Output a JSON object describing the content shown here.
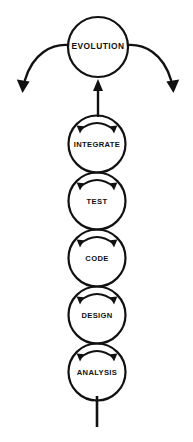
{
  "diagram": {
    "type": "flow-diagram",
    "background_color": "#ffffff",
    "stroke_color": "#111111",
    "text_color": "#111111",
    "top_node": {
      "id": "evolution",
      "label": "EVOLUTION",
      "shape": "circle",
      "cx": 98,
      "cy": 47,
      "r": 30,
      "stroke_width": 2.2
    },
    "stages": [
      {
        "id": "integrate",
        "label": "INTEGRATE",
        "shape": "circle",
        "cx": 97,
        "cy": 144,
        "r": 28.5,
        "stroke_width": 2.2,
        "order": 1
      },
      {
        "id": "test",
        "label": "TEST",
        "shape": "circle",
        "cx": 97,
        "cy": 201,
        "r": 28.5,
        "stroke_width": 2.2,
        "order": 2
      },
      {
        "id": "code",
        "label": "CODE",
        "shape": "circle",
        "cx": 97,
        "cy": 258,
        "r": 28.5,
        "stroke_width": 2.2,
        "order": 3
      },
      {
        "id": "design",
        "label": "DESIGN",
        "shape": "circle",
        "cx": 97,
        "cy": 315,
        "r": 28.5,
        "stroke_width": 2.2,
        "order": 4
      },
      {
        "id": "analysis",
        "label": "ANALYSIS",
        "shape": "circle",
        "cx": 97,
        "cy": 372,
        "r": 28.5,
        "stroke_width": 2.2,
        "order": 5
      }
    ],
    "connectors": {
      "entry_line": {
        "id": "entry-line",
        "description": "vertical line entering the stack from below ANALYSIS",
        "x": 97,
        "y_start": 400,
        "y_end": 427,
        "stroke_width": 2.6,
        "arrow": false
      },
      "evolution_arrow": {
        "id": "evolution-arrow",
        "description": "vertical arrow from INTEGRATE up into EVOLUTION",
        "x": 98,
        "y_start": 116,
        "y_end": 80,
        "stroke_width": 2.4,
        "arrow": true,
        "arrow_direction": "up"
      },
      "branch_left": {
        "id": "evolution-branch-left",
        "description": "curved arrow diverging from EVOLUTION down to the left",
        "arrow_tip_x": 23,
        "arrow_tip_y": 93,
        "stroke_width": 2.4,
        "arrow": true,
        "arrow_direction": "down-left"
      },
      "branch_right": {
        "id": "evolution-branch-right",
        "description": "curved arrow diverging from EVOLUTION down to the right",
        "arrow_tip_x": 173,
        "arrow_tip_y": 93,
        "stroke_width": 2.4,
        "arrow": true,
        "arrow_direction": "down-right"
      },
      "feedback_arcs": {
        "description": "double-headed arc spanning the top of each stage circle, indicating iteration between adjacent stages",
        "count": 5,
        "stroke_width": 1.9,
        "arrow_direction": "both-outward-down"
      }
    }
  }
}
